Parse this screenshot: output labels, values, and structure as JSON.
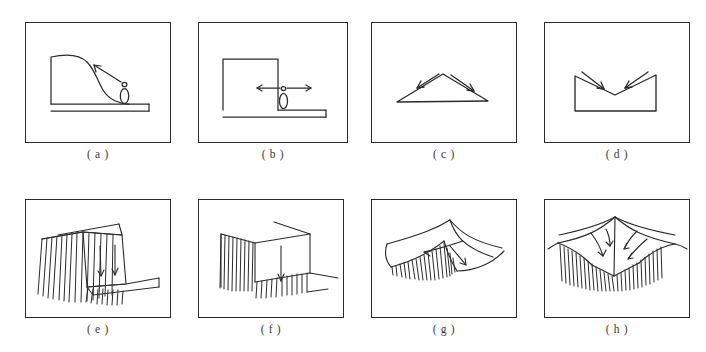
{
  "figure": {
    "name": "landslide-and-fold-mechanism-diagrams",
    "background_color": "#ffffff",
    "line_color": "#2b2b2b",
    "panel_count": 8,
    "rows": 2,
    "columns": 4
  },
  "panels": [
    {
      "id": "a",
      "caption": "( a )",
      "name": "panel-a-slope-creep-profile",
      "description": "Cross-section of a rounded convex slope with flat ground surface, a standing human figure at the slope toe, and an arrow pointing up-slope",
      "x": 25,
      "y": 22,
      "width": 146,
      "height": 121,
      "caption_y": 148,
      "elements": [
        "slope-profile",
        "ground-line",
        "human-figure",
        "up-slope-arrow"
      ]
    },
    {
      "id": "b",
      "caption": "( b )",
      "name": "panel-b-vertical-scarp-profile",
      "description": "Cross-section of a vertical cliff or fault scarp with a flat bench, a standing human figure at the base, and a double-headed horizontal arrow for scale",
      "x": 198,
      "y": 22,
      "width": 150,
      "height": 121,
      "caption_y": 148,
      "elements": [
        "scarp-block",
        "bench-line",
        "human-figure",
        "double-headed-arrow"
      ]
    },
    {
      "id": "c",
      "caption": "( c )",
      "name": "panel-c-anticline-divergent-arrows",
      "description": "Triangular anticline shape with two arrows diverging outward and downward from the crest",
      "x": 371,
      "y": 22,
      "width": 146,
      "height": 121,
      "caption_y": 148,
      "elements": [
        "triangle-outline",
        "left-divergent-arrow",
        "right-divergent-arrow"
      ]
    },
    {
      "id": "d",
      "caption": "( d )",
      "name": "panel-d-syncline-convergent-arrows",
      "description": "V-shaped syncline within a rectangular block with two arrows converging inward and downward toward the trough",
      "x": 544,
      "y": 22,
      "width": 146,
      "height": 121,
      "caption_y": 148,
      "elements": [
        "v-notch-block",
        "left-convergent-arrow",
        "right-convergent-arrow"
      ]
    },
    {
      "id": "e",
      "caption": "( e )",
      "name": "panel-e-block-slide-with-hachures",
      "description": "Three-dimensional block diagram of a translational slide: hachured head scarp on the left, a tilted displaced block in the middle with two downslope movement arrows, and a lower bench",
      "x": 25,
      "y": 199,
      "width": 146,
      "height": 119,
      "caption_y": 324,
      "elements": [
        "hachured-scarp",
        "displaced-block",
        "movement-arrow-left",
        "movement-arrow-right",
        "lower-bench"
      ]
    },
    {
      "id": "f",
      "caption": "( f )",
      "name": "panel-f-block-subsidence-with-hachures",
      "description": "Three-dimensional block diagram of a downdropped block bounded by hachured scarps, with a single vertical downward arrow on the block face",
      "x": 198,
      "y": 199,
      "width": 146,
      "height": 119,
      "caption_y": 324,
      "elements": [
        "hachured-scarp-left",
        "hachured-scarp-front",
        "downdropped-block",
        "vertical-down-arrow"
      ]
    },
    {
      "id": "g",
      "caption": "( g )",
      "name": "panel-g-curved-slump-single-lobe",
      "description": "Perspective landscape sketch of a single curved slump lobe with a hachured arcuate scarp and two curved arrows showing divergent flow directions",
      "x": 371,
      "y": 199,
      "width": 146,
      "height": 119,
      "caption_y": 324,
      "elements": [
        "ridge-crest-lines",
        "hachured-arcuate-scarp",
        "curved-arrow-left",
        "curved-arrow-right"
      ]
    },
    {
      "id": "h",
      "caption": "( h )",
      "name": "panel-h-curved-slump-double-lobe",
      "description": "Perspective landscape sketch of a symmetric double slump basin with a broad hachured scarp and four curved arrows converging toward the central axis",
      "x": 544,
      "y": 199,
      "width": 146,
      "height": 119,
      "caption_y": 324,
      "elements": [
        "ridge-crest-lines",
        "hachured-scarp-band",
        "curved-arrow-1",
        "curved-arrow-2",
        "curved-arrow-3",
        "curved-arrow-4"
      ]
    }
  ]
}
